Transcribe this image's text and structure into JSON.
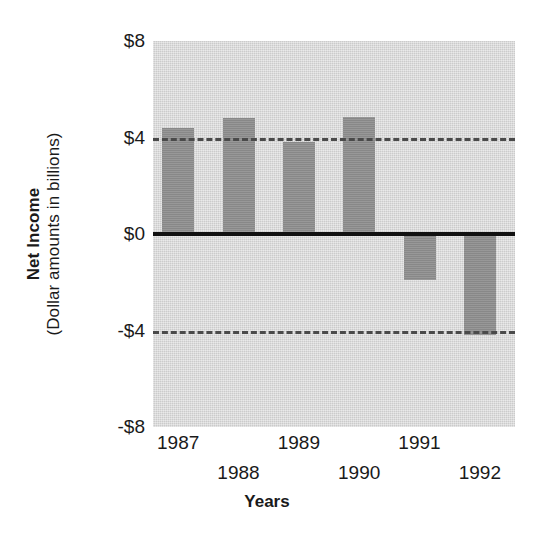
{
  "chart_data": {
    "type": "bar",
    "title": "",
    "xlabel": "Years",
    "ylabel": "Net Income",
    "ylabel_sub": "(Dollar amounts in billions)",
    "categories": [
      "1987",
      "1988",
      "1989",
      "1990",
      "1991",
      "1992"
    ],
    "values": [
      4.4,
      4.8,
      3.8,
      4.85,
      -1.9,
      -4.2
    ],
    "series": [
      {
        "name": "Net Income",
        "values": [
          4.4,
          4.8,
          3.8,
          4.85,
          -1.9,
          -4.2
        ]
      }
    ],
    "ylim": [
      -8,
      8
    ],
    "yticks": [
      8,
      4,
      0,
      -4,
      -8
    ],
    "ytick_labels": [
      "$8",
      "$4",
      "$0",
      "-$4",
      "-$8"
    ],
    "gridlines": [
      {
        "value": 4,
        "style": "dashed"
      },
      {
        "value": 0,
        "style": "solid"
      },
      {
        "value": -4,
        "style": "dashed"
      }
    ],
    "grid": true,
    "legend": "none",
    "bar_color": "#8f8f8f",
    "plot_background": "#d6d6d6",
    "axis_color": "#111111",
    "gridline_color": "#4a4a4a"
  },
  "axes": {
    "y": {
      "title_main": "Net Income",
      "title_sub": "(Dollar amounts in billions)",
      "ticks": [
        {
          "label": "$8",
          "value": 8
        },
        {
          "label": "$4",
          "value": 4
        },
        {
          "label": "$0",
          "value": 0
        },
        {
          "label": "-$4",
          "value": -4
        },
        {
          "label": "-$8",
          "value": -8
        }
      ]
    },
    "x": {
      "title": "Years",
      "ticks": [
        {
          "label": "1987",
          "row": 0
        },
        {
          "label": "1988",
          "row": 1
        },
        {
          "label": "1989",
          "row": 0
        },
        {
          "label": "1990",
          "row": 1
        },
        {
          "label": "1991",
          "row": 0
        },
        {
          "label": "1992",
          "row": 1
        }
      ]
    }
  }
}
